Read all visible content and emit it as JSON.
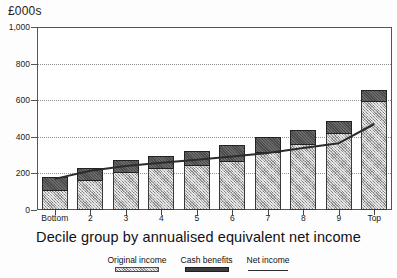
{
  "chart_data": {
    "type": "bar",
    "title": "",
    "ylabel": "£000s",
    "xlabel": "Decile group by annualised equivalent net income",
    "categories": [
      "Bottom",
      "2",
      "3",
      "4",
      "5",
      "6",
      "7",
      "8",
      "9",
      "Top"
    ],
    "ylim": [
      0,
      1000
    ],
    "yticks": [
      0,
      200,
      400,
      600,
      800,
      1000
    ],
    "ytick_labels": [
      "0",
      "200",
      "400",
      "600",
      "800",
      "1,000"
    ],
    "grid": true,
    "grid_style": "dotted horizontal",
    "legend_position": "bottom",
    "stacked": true,
    "series": [
      {
        "name": "Original income",
        "kind": "bar-segment",
        "color": "#b2b2b2",
        "pattern": "light-hatch",
        "values": [
          115,
          170,
          215,
          235,
          250,
          275,
          320,
          365,
          425,
          600
        ]
      },
      {
        "name": "Cash benefits",
        "kind": "bar-segment",
        "color": "#4a4a4a",
        "pattern": "dark-solid",
        "values": [
          65,
          60,
          57,
          62,
          75,
          78,
          78,
          72,
          62,
          55
        ]
      },
      {
        "name": "Net income",
        "kind": "line",
        "color": "#2b2b2b",
        "values": [
          170,
          215,
          240,
          258,
          275,
          292,
          312,
          338,
          365,
          470
        ]
      }
    ],
    "bar_totals": [
      180,
      230,
      272,
      297,
      325,
      353,
      398,
      437,
      487,
      655
    ]
  },
  "legend": {
    "items": [
      {
        "label": "Original income",
        "swatch": "original-income-swatch"
      },
      {
        "label": "Cash benefits",
        "swatch": "cash-benefits-swatch"
      },
      {
        "label": "Net income",
        "swatch": "net-income-line-swatch"
      }
    ]
  }
}
